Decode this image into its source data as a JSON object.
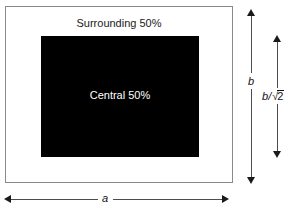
{
  "figure": {
    "type": "diagram",
    "outer_region": {
      "label": "Surrounding 50%",
      "fill_color": "#ffffff",
      "border_color": "#8a8a8a",
      "width_symbol": "a",
      "height_symbol": "b"
    },
    "inner_region": {
      "label": "Central 50%",
      "fill_color": "#000000",
      "text_color": "#ffffff",
      "height_symbol": "b/√2"
    },
    "dimensions": [
      {
        "name": "outer-height",
        "symbol": "b",
        "orientation": "vertical"
      },
      {
        "name": "inner-height",
        "symbol_numerator": "b",
        "symbol_divider": "/",
        "symbol_radical": "√",
        "symbol_radicand": "2",
        "orientation": "vertical"
      },
      {
        "name": "outer-width",
        "symbol": "a",
        "orientation": "horizontal"
      }
    ]
  }
}
